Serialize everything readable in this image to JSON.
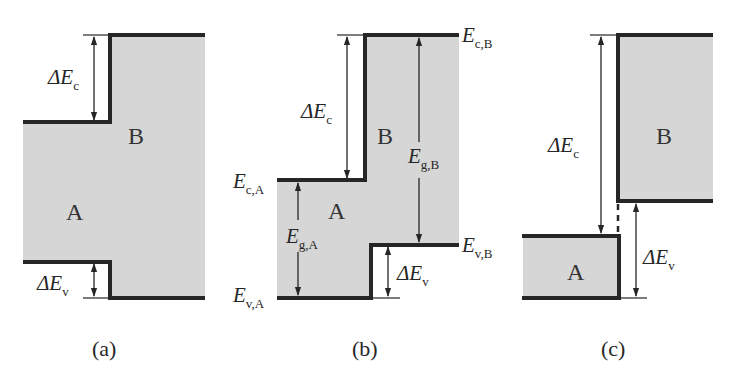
{
  "figure": {
    "panels": [
      {
        "id": "a",
        "caption": "(a)",
        "material_a": "A",
        "material_b": "B",
        "delta_ec": {
          "symbol": "ΔE",
          "sub": "c"
        },
        "delta_ev": {
          "symbol": "ΔE",
          "sub": "v"
        },
        "alignment": "straddling (type I)"
      },
      {
        "id": "b",
        "caption": "(b)",
        "material_a": "A",
        "material_b": "B",
        "delta_ec": {
          "symbol": "ΔE",
          "sub": "c"
        },
        "delta_ev": {
          "symbol": "ΔE",
          "sub": "v"
        },
        "ec_a": {
          "symbol": "E",
          "sub": "c,A"
        },
        "ev_a": {
          "symbol": "E",
          "sub": "v,A"
        },
        "ec_b": {
          "symbol": "E",
          "sub": "c,B"
        },
        "ev_b": {
          "symbol": "E",
          "sub": "v,B"
        },
        "eg_a": {
          "symbol": "E",
          "sub": "g,A"
        },
        "eg_b": {
          "symbol": "E",
          "sub": "g,B"
        },
        "alignment": "staggered (type II)"
      },
      {
        "id": "c",
        "caption": "(c)",
        "material_a": "A",
        "material_b": "B",
        "delta_ec": {
          "symbol": "ΔE",
          "sub": "c"
        },
        "delta_ev": {
          "symbol": "ΔE",
          "sub": "v"
        },
        "alignment": "broken gap (type III)"
      }
    ],
    "colors": {
      "band_line": "#262626",
      "gap_fill": "#d6d6d6",
      "text": "#262626"
    }
  }
}
